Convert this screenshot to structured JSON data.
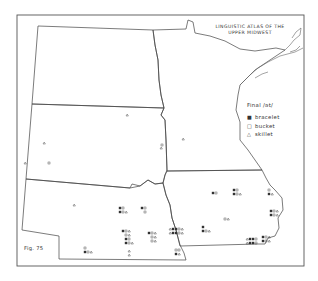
{
  "title": {
    "line1": "LINGUISTIC ATLAS OF THE",
    "line2": "UPPER MIDWEST"
  },
  "legend": {
    "heading": "Final /ət/",
    "items": [
      {
        "symbol": "■",
        "symbol_name": "filled-square",
        "label": "bracelet"
      },
      {
        "symbol": "□",
        "symbol_name": "open-square",
        "label": "bucket"
      },
      {
        "symbol": "△",
        "symbol_name": "triangle",
        "label": "skillet"
      }
    ]
  },
  "figure_label": "Fig. 75",
  "regions": [
    "North Dakota",
    "South Dakota",
    "Nebraska",
    "Minnesota",
    "Iowa"
  ],
  "colors": {
    "ink": "#444444",
    "paper": "#ffffff"
  }
}
